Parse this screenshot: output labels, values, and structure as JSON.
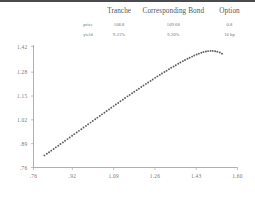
{
  "page": {
    "rule_color": "#4a4b4f",
    "background": "#ffffff",
    "text_color": "#55565a"
  },
  "summary": {
    "columns": [
      "",
      "Tranche",
      "Corresponding Bond",
      "Option"
    ],
    "rows": [
      {
        "label": "price",
        "tranche": "108.8",
        "bond": "109.68",
        "option": "0.8"
      },
      {
        "label": "yield",
        "tranche": "9.21%",
        "bond": "9.20%",
        "option": "10 bp"
      }
    ]
  },
  "chart_data": {
    "type": "scatter",
    "title": "",
    "xlabel": "",
    "ylabel": "",
    "grid": false,
    "legend": null,
    "xlim": [
      0.76,
      1.6
    ],
    "ylim": [
      0.76,
      1.42
    ],
    "xticks": [
      0.76,
      0.92,
      1.09,
      1.26,
      1.43,
      1.6
    ],
    "xticklabels": [
      ".76",
      ".92",
      "1.09",
      "1.26",
      "1.43",
      "1.60"
    ],
    "yticks": [
      0.76,
      0.89,
      1.02,
      1.15,
      1.28,
      1.42
    ],
    "yticklabels": [
      ".76",
      ".89",
      "1.02",
      "1.15",
      "1.28",
      "1.42"
    ],
    "marker": "dot",
    "marker_color": "#5d5e63",
    "marker_size": 0.95,
    "x": [
      0.805,
      0.815,
      0.824,
      0.833,
      0.843,
      0.852,
      0.862,
      0.871,
      0.881,
      0.89,
      0.9,
      0.909,
      0.919,
      0.928,
      0.938,
      0.947,
      0.957,
      0.966,
      0.976,
      0.985,
      0.995,
      1.004,
      1.014,
      1.023,
      1.033,
      1.042,
      1.052,
      1.061,
      1.071,
      1.08,
      1.09,
      1.099,
      1.109,
      1.118,
      1.128,
      1.137,
      1.147,
      1.156,
      1.166,
      1.175,
      1.185,
      1.194,
      1.204,
      1.213,
      1.223,
      1.232,
      1.242,
      1.251,
      1.261,
      1.27,
      1.28,
      1.289,
      1.299,
      1.308,
      1.318,
      1.327,
      1.337,
      1.346,
      1.356,
      1.365,
      1.375,
      1.384,
      1.394,
      1.403,
      1.413,
      1.422,
      1.432,
      1.441,
      1.451,
      1.46,
      1.47,
      1.479,
      1.489,
      1.498,
      1.508,
      1.517,
      1.527,
      1.536
    ],
    "y": [
      0.826,
      0.835,
      0.843,
      0.852,
      0.861,
      0.87,
      0.879,
      0.888,
      0.897,
      0.906,
      0.915,
      0.924,
      0.933,
      0.942,
      0.951,
      0.96,
      0.969,
      0.978,
      0.987,
      0.996,
      1.005,
      1.014,
      1.023,
      1.032,
      1.041,
      1.05,
      1.059,
      1.068,
      1.077,
      1.086,
      1.095,
      1.104,
      1.112,
      1.121,
      1.13,
      1.139,
      1.148,
      1.156,
      1.165,
      1.173,
      1.182,
      1.19,
      1.199,
      1.207,
      1.216,
      1.224,
      1.232,
      1.24,
      1.249,
      1.257,
      1.265,
      1.273,
      1.281,
      1.288,
      1.296,
      1.304,
      1.311,
      1.318,
      1.326,
      1.333,
      1.34,
      1.346,
      1.353,
      1.359,
      1.365,
      1.371,
      1.376,
      1.381,
      1.386,
      1.39,
      1.393,
      1.395,
      1.396,
      1.396,
      1.394,
      1.391,
      1.387,
      1.381
    ]
  }
}
